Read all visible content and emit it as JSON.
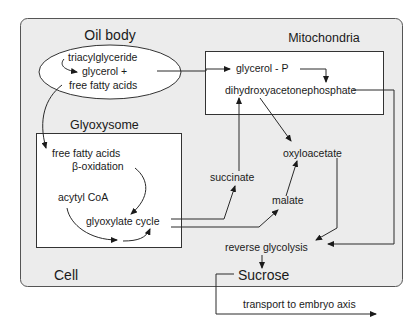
{
  "diagram": {
    "compartments": {
      "cell": {
        "label": "Cell",
        "fill": "#ececec",
        "stroke": "#555555"
      },
      "oil_body": {
        "label": "Oil body",
        "fill": "#ffffff"
      },
      "glyoxysome": {
        "label": "Glyoxysome",
        "fill": "#ffffff"
      },
      "mitochondria": {
        "label": "Mitochondria",
        "fill": "#ffffff"
      }
    },
    "nodes": {
      "triacylglyceride": "triacylglyceride",
      "glycerol_plus": "glycerol +",
      "free_fatty_acids_oil": "free fatty acids",
      "free_fatty_acids": "free fatty acids",
      "beta_oxidation": "β-oxidation",
      "acytyl_coa": "acytyl CoA",
      "glyoxylate_cycle": "glyoxylate cycle",
      "glycerol_p": "glycerol - P",
      "dhap": "dihydroxyacetonephosphate",
      "succinate": "succinate",
      "oxyloacetate": "oxyloacetate",
      "malate": "malate",
      "reverse_glycolysis": "reverse glycolysis",
      "sucrose": "Sucrose",
      "transport": "transport to embryo axis"
    },
    "edges": [
      {
        "from": "triacylglyceride",
        "to": "glycerol +"
      },
      {
        "from": "glycerol + free fatty acids",
        "to": "glycerol - P"
      },
      {
        "from": "free fatty acids (oil body)",
        "to": "free fatty acids (glyoxysome)"
      },
      {
        "from": "free fatty acids",
        "to": "glyoxylate cycle",
        "via": "β-oxidation"
      },
      {
        "from": "acytyl CoA",
        "to": "glyoxylate cycle"
      },
      {
        "from": "glycerol - P",
        "to": "dihydroxyacetonephosphate"
      },
      {
        "from": "glyoxylate cycle",
        "to": "succinate"
      },
      {
        "from": "glyoxylate cycle",
        "to": "malate"
      },
      {
        "from": "succinate",
        "to": "dihydroxyacetonephosphate"
      },
      {
        "from": "dihydroxyacetonephosphate",
        "to": "oxyloacetate"
      },
      {
        "from": "malate",
        "to": "oxyloacetate"
      },
      {
        "from": "oxyloacetate",
        "to": "reverse glycolysis"
      },
      {
        "from": "dihydroxyacetonephosphate",
        "to": "reverse glycolysis"
      },
      {
        "from": "reverse glycolysis",
        "to": "Sucrose"
      },
      {
        "from": "Sucrose",
        "to": "transport to embryo axis"
      }
    ]
  }
}
